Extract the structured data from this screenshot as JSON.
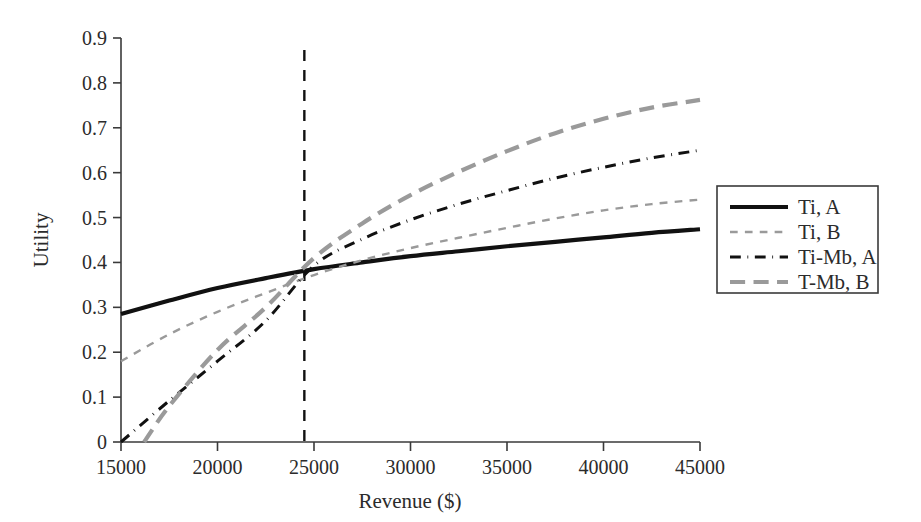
{
  "chart_data": {
    "type": "line",
    "title": "",
    "xlabel": "Revenue ($)",
    "ylabel": "Utility",
    "xlim": [
      15000,
      45000
    ],
    "ylim": [
      0,
      0.9
    ],
    "xticks": [
      15000,
      20000,
      25000,
      30000,
      35000,
      40000,
      45000
    ],
    "xtick_labels": [
      "15000",
      "20000",
      "25000",
      "30000",
      "35000",
      "40000",
      "45000"
    ],
    "yticks": [
      0,
      0.1,
      0.2,
      0.3,
      0.4,
      0.5,
      0.6,
      0.7,
      0.8,
      0.9
    ],
    "ytick_labels": [
      "0",
      "0.1",
      "0.2",
      "0.3",
      "0.4",
      "0.5",
      "0.6",
      "0.7",
      "0.8",
      "0.9"
    ],
    "grid": false,
    "legend_position": "right-outside",
    "annotations": [
      {
        "name": "crossover-reference-line",
        "type": "vline",
        "x": 24500,
        "style": "dashed",
        "color": "#111111"
      }
    ],
    "series": [
      {
        "name": "Ti, A",
        "style": "solid",
        "color": "#111111",
        "width": 4.2,
        "x": [
          15000,
          17500,
          20000,
          22500,
          25000,
          27500,
          30000,
          32500,
          35000,
          37500,
          40000,
          42500,
          45000
        ],
        "values": [
          0.285,
          0.315,
          0.343,
          0.365,
          0.385,
          0.4,
          0.414,
          0.425,
          0.436,
          0.446,
          0.456,
          0.466,
          0.474
        ]
      },
      {
        "name": "Ti, B",
        "style": "dashed",
        "color": "#9a9a9a",
        "width": 2.4,
        "x": [
          15000,
          17500,
          20000,
          22500,
          25000,
          27500,
          30000,
          32500,
          35000,
          37500,
          40000,
          42500,
          45000
        ],
        "values": [
          0.18,
          0.24,
          0.29,
          0.332,
          0.372,
          0.405,
          0.432,
          0.455,
          0.477,
          0.498,
          0.516,
          0.53,
          0.54
        ]
      },
      {
        "name": "Ti-Mb, A",
        "style": "dashdot",
        "color": "#111111",
        "width": 3.0,
        "x": [
          15000,
          17500,
          20000,
          22500,
          25000,
          27500,
          30000,
          32500,
          35000,
          37500,
          40000,
          42500,
          45000
        ],
        "values": [
          0.0,
          0.092,
          0.18,
          0.27,
          0.393,
          0.452,
          0.495,
          0.53,
          0.56,
          0.588,
          0.612,
          0.633,
          0.65
        ]
      },
      {
        "name": "T-Mb, B",
        "style": "longdash",
        "color": "#9a9a9a",
        "width": 4.2,
        "x": [
          16200,
          17500,
          20000,
          22500,
          25000,
          27500,
          30000,
          32500,
          35000,
          37500,
          40000,
          42500,
          45000
        ],
        "values": [
          0.0,
          0.08,
          0.205,
          0.3,
          0.41,
          0.487,
          0.55,
          0.602,
          0.648,
          0.688,
          0.72,
          0.745,
          0.762
        ]
      }
    ]
  },
  "legend": {
    "entries": [
      {
        "label": "Ti, A"
      },
      {
        "label": "Ti, B"
      },
      {
        "label": "Ti-Mb, A"
      },
      {
        "label": "T-Mb, B"
      }
    ]
  }
}
